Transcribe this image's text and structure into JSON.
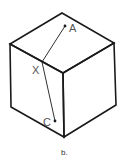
{
  "figure": {
    "caption": "b.",
    "points": {
      "A": "A",
      "X": "X",
      "C": "C"
    },
    "colors": {
      "stroke": "#1a1a1a",
      "label": "#555555"
    }
  }
}
